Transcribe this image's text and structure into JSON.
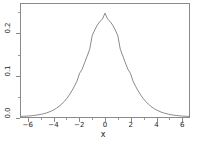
{
  "chart_data": {
    "type": "line",
    "title": "",
    "subtitle": "",
    "xlabel": "x",
    "ylabel": "",
    "xlim": [
      -6.6,
      6.6
    ],
    "ylim": [
      0.0,
      0.272
    ],
    "grid": false,
    "legend": null,
    "xticks": [
      {
        "value": -6,
        "label": "−6"
      },
      {
        "value": -4,
        "label": "−4"
      },
      {
        "value": -2,
        "label": "−2"
      },
      {
        "value": 0,
        "label": "0"
      },
      {
        "value": 2,
        "label": "2"
      },
      {
        "value": 4,
        "label": "4"
      },
      {
        "value": 6,
        "label": "6"
      }
    ],
    "xticks_minor": [
      -5,
      -3,
      -1,
      1,
      3,
      5
    ],
    "yticks": [
      {
        "value": 0.0,
        "label": "0.0"
      },
      {
        "value": 0.1,
        "label": "0.1"
      },
      {
        "value": 0.2,
        "label": "0.2"
      }
    ],
    "yticks_minor": [
      0.05,
      0.15,
      0.25
    ],
    "series": [
      {
        "name": "density",
        "color": "#6b6b6b",
        "linewidth": 0.8,
        "x": [
          -6.6,
          -6.4,
          -6.2,
          -6.0,
          -5.8,
          -5.6,
          -5.4,
          -5.2,
          -5.0,
          -4.8,
          -4.6,
          -4.4,
          -4.2,
          -4.0,
          -3.8,
          -3.6,
          -3.4,
          -3.2,
          -3.0,
          -2.8,
          -2.6,
          -2.4,
          -2.2,
          -2.0,
          -1.8,
          -1.6,
          -1.4,
          -1.2,
          -1.0,
          -0.8,
          -0.6,
          -0.4,
          -0.2,
          0.0,
          0.2,
          0.4,
          0.6,
          0.8,
          1.0,
          1.2,
          1.4,
          1.6,
          1.8,
          2.0,
          2.2,
          2.4,
          2.6,
          2.8,
          3.0,
          3.2,
          3.4,
          3.6,
          3.8,
          4.0,
          4.2,
          4.4,
          4.6,
          4.8,
          5.0,
          5.2,
          5.4,
          5.6,
          5.8,
          6.0,
          6.2,
          6.4,
          6.6
        ],
        "y": [
          0.0014,
          0.0017,
          0.002,
          0.0025,
          0.003,
          0.0037,
          0.0045,
          0.0055,
          0.0066,
          0.0081,
          0.0099,
          0.012,
          0.0146,
          0.0177,
          0.0214,
          0.0258,
          0.0311,
          0.0373,
          0.0447,
          0.0532,
          0.063,
          0.0742,
          0.0866,
          0.105,
          0.1148,
          0.1306,
          0.1469,
          0.1633,
          0.1966,
          0.21,
          0.2213,
          0.2301,
          0.2358,
          0.25,
          0.2358,
          0.2301,
          0.2213,
          0.21,
          0.1966,
          0.1633,
          0.1469,
          0.1306,
          0.1148,
          0.105,
          0.0866,
          0.0742,
          0.063,
          0.0532,
          0.0447,
          0.0373,
          0.0311,
          0.0258,
          0.0214,
          0.0177,
          0.0146,
          0.012,
          0.0099,
          0.0081,
          0.0066,
          0.0055,
          0.0045,
          0.0037,
          0.003,
          0.0025,
          0.002,
          0.0017,
          0.0014
        ]
      }
    ],
    "peak": {
      "x": 0.0,
      "y": 0.25
    },
    "annotations": []
  },
  "axes": {
    "frame_color": "#8a8a8a",
    "tick_color": "#8a8a8a",
    "text_color": "#1a1a1a"
  }
}
